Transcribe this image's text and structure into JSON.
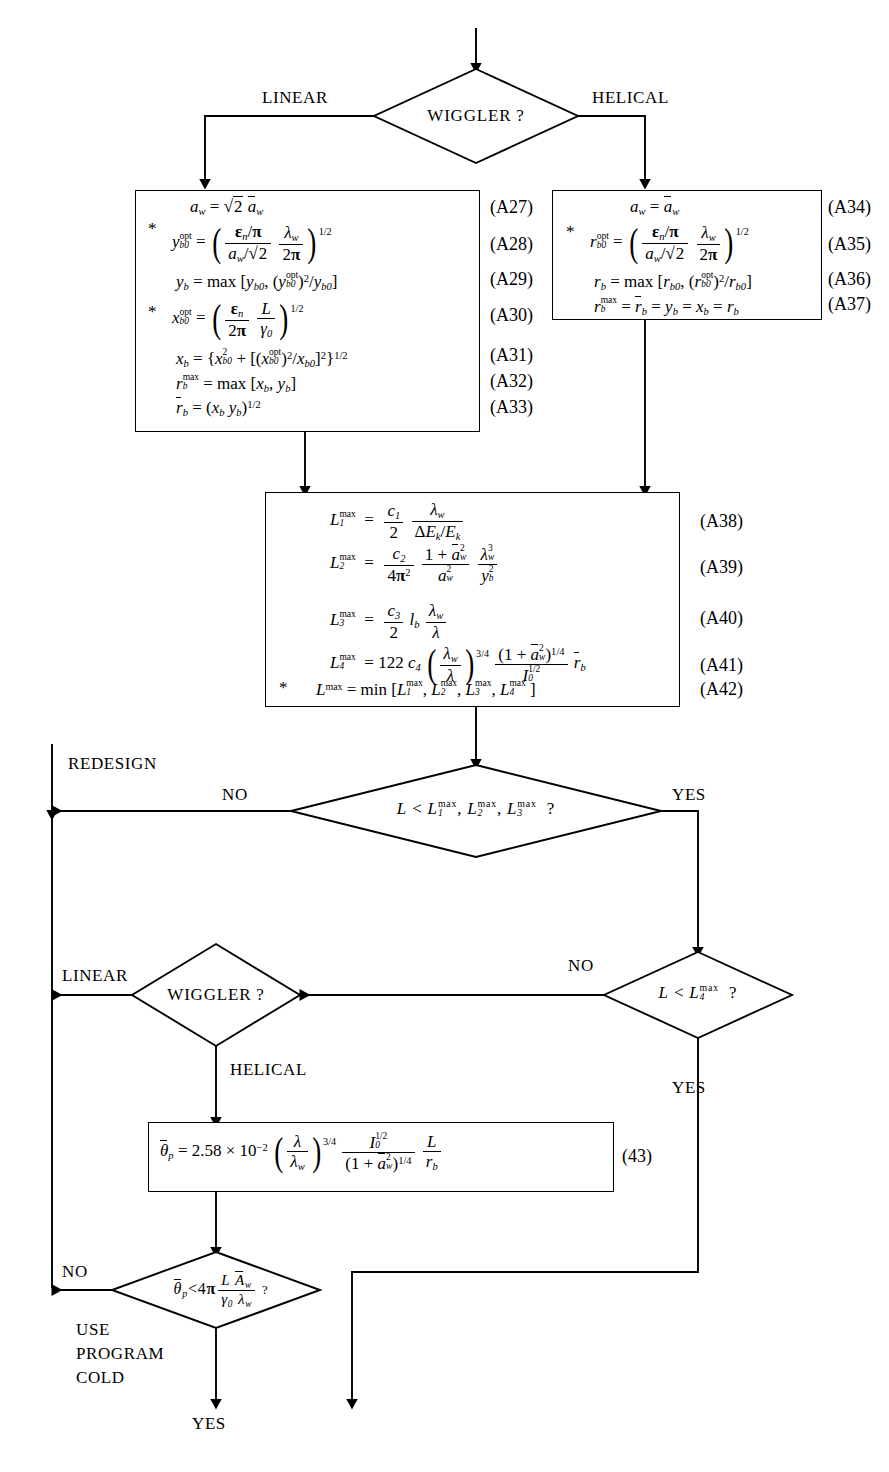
{
  "diagram": {
    "ink_color": "#000000",
    "background": "#ffffff"
  },
  "decisions": {
    "wiggler_top": {
      "text": "WIGGLER ?",
      "left_branch": "LINEAR",
      "right_branch": "HELICAL"
    },
    "length_check": {
      "text": "L < L₁max, L₂max, L₃max  ?",
      "no_branch": "NO",
      "yes_branch": "YES"
    },
    "l4_check": {
      "text": "L < L₄max  ?",
      "no_branch": "NO",
      "yes_branch": "YES"
    },
    "wiggler_second": {
      "text": "WIGGLER ?",
      "left_branch": "LINEAR",
      "down_branch": "HELICAL"
    },
    "theta_check": {
      "text": "θ̄p < 4π L Āw / (γ₀ λw)  ?",
      "no_branch": "NO",
      "yes_branch": "YES"
    }
  },
  "labels": {
    "redesign": "REDESIGN",
    "use_program_cold": [
      "USE",
      "PROGRAM",
      "COLD"
    ],
    "yes": "YES",
    "no": "NO",
    "linear": "LINEAR",
    "helical": "HELICAL"
  },
  "linear_box": {
    "equations": [
      {
        "tag": "(A27)",
        "star": false,
        "text": "a_w = √2 ā_w"
      },
      {
        "tag": "(A28)",
        "star": true,
        "text": "y_b0^opt = ( (ε_n/π)/(a_w/√2) · λ_w/2π )^1/2"
      },
      {
        "tag": "(A29)",
        "star": false,
        "text": "y_b = max [y_b0, (y_b0^opt)^2/y_b0]"
      },
      {
        "tag": "(A30)",
        "star": true,
        "text": "x_b0^opt = ( ε_n/2π · L/γ_0 )^1/2"
      },
      {
        "tag": "(A31)",
        "star": false,
        "text": "x_b = {x_b0^2 + [(x_b0^opt)^2/x_b0]^2}^1/2"
      },
      {
        "tag": "(A32)",
        "star": false,
        "text": "r_b^max = max [x_b, y_b]"
      },
      {
        "tag": "(A33)",
        "star": false,
        "text": "r̄_b = (x_b y_b)^1/2"
      }
    ]
  },
  "helical_box": {
    "equations": [
      {
        "tag": "(A34)",
        "star": false,
        "text": "a_w = ā_w"
      },
      {
        "tag": "(A35)",
        "star": true,
        "text": "r_b0^opt = ( (ε_n/π)/(a_w/√2) · λ_w/2π )^1/2"
      },
      {
        "tag": "(A36)",
        "star": false,
        "text": "r_b = max [r_b0, (r_b0^opt)^2/r_b0]"
      },
      {
        "tag": "(A37)",
        "star": false,
        "text": "r_b^max = r̄_b = y_b = x_b = r_b"
      }
    ]
  },
  "lmax_box": {
    "equations": [
      {
        "tag": "(A38)",
        "star": false,
        "text": "L₁max = (c₁/2) · λ_w/(ΔE_k/E_k)"
      },
      {
        "tag": "(A39)",
        "star": false,
        "text": "L₂max = (c₂/4π²) · (1+ā_w²)/a_w² · λ_w³/y_b²"
      },
      {
        "tag": "(A40)",
        "star": false,
        "text": "L₃max = (c₃/2) l_b λ_w/λ"
      },
      {
        "tag": "(A41)",
        "star": false,
        "text": "L₄max = 122 c₄ (λ_w/λ)^3/4 · (1+ā_w²)^1/4 / I₀^1/2 · r̄_b"
      },
      {
        "tag": "(A42)",
        "star": true,
        "text": "Lmax = min [L₁max, L₂max, L₃max, L₄max]"
      }
    ]
  },
  "theta_box": {
    "tag": "(43)",
    "equation": "θ̄_p = 2.58 × 10⁻² (λ/λ_w)^3/4 · I₀^1/2/(1+ā_w²)^1/4 · L/r̄_b"
  }
}
